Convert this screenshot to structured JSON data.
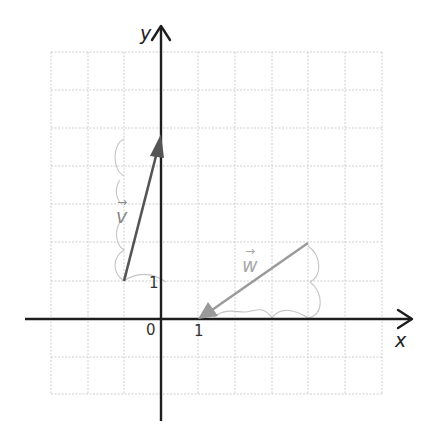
{
  "diagram": {
    "type": "coordinate-plane-vectors",
    "axes": {
      "x_label": "x",
      "y_label": "y",
      "origin_label": "0",
      "x_tick_label": "1",
      "y_tick_label": "1",
      "x_range": [
        -3,
        6
      ],
      "y_range": [
        -2,
        7
      ]
    },
    "vectors": [
      {
        "name": "v",
        "label": "v",
        "arrow_symbol": "→",
        "tail": [
          -1,
          1
        ],
        "head": [
          0,
          5
        ],
        "components": [
          1,
          4
        ],
        "color": "#555555"
      },
      {
        "name": "w",
        "label": "w",
        "arrow_symbol": "→",
        "tail": [
          4,
          2
        ],
        "head": [
          1,
          0
        ],
        "components": [
          -3,
          -2
        ],
        "color": "#9a9a9a"
      }
    ],
    "colors": {
      "axis": "#1e1e1e",
      "grid": "#cfcfcf",
      "annotation": "#c4c4c4"
    }
  }
}
